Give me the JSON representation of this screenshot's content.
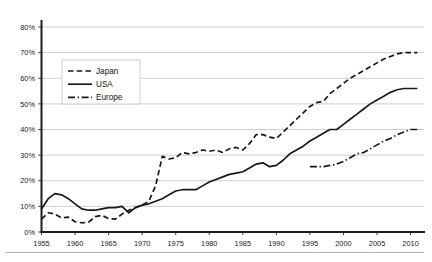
{
  "chart_data": {
    "type": "line",
    "title": "",
    "subtitle": "",
    "xlabel": "",
    "ylabel": "",
    "xlim": [
      1955,
      2012
    ],
    "ylim": [
      0,
      80
    ],
    "ytick_labels": [
      "0%",
      "10%",
      "20%",
      "30%",
      "40%",
      "50%",
      "60%",
      "70%",
      "80%"
    ],
    "ytick_values": [
      0,
      10,
      20,
      30,
      40,
      50,
      60,
      70,
      80
    ],
    "xtick_labels": [
      "1955",
      "1960",
      "1965",
      "1970",
      "1975",
      "1980",
      "1985",
      "1990",
      "1995",
      "2000",
      "2005",
      "2010"
    ],
    "xtick_values": [
      1955,
      1960,
      1965,
      1970,
      1975,
      1980,
      1985,
      1990,
      1995,
      2000,
      2005,
      2010
    ],
    "grid": true,
    "legend_position": "upper-left-inside",
    "legend": [
      "Japan",
      "USA",
      "Europe"
    ],
    "series": [
      {
        "name": "Japan",
        "style": "dashed",
        "x": [
          1955,
          1956,
          1957,
          1958,
          1959,
          1960,
          1961,
          1962,
          1963,
          1964,
          1965,
          1966,
          1967,
          1968,
          1969,
          1970,
          1971,
          1972,
          1973,
          1974,
          1975,
          1976,
          1977,
          1978,
          1979,
          1980,
          1981,
          1982,
          1983,
          1984,
          1985,
          1986,
          1987,
          1988,
          1989,
          1990,
          1991,
          1992,
          1993,
          1994,
          1995,
          1996,
          1997,
          1998,
          1999,
          2000,
          2001,
          2002,
          2003,
          2004,
          2005,
          2006,
          2007,
          2008,
          2009,
          2010,
          2011
        ],
        "values": [
          5.0,
          7.5,
          7.0,
          5.5,
          5.8,
          4.0,
          3.6,
          3.8,
          6.0,
          6.5,
          5.2,
          5.0,
          7.0,
          8.5,
          9.5,
          10.5,
          12.0,
          18.0,
          29.5,
          28.5,
          29.0,
          31.0,
          30.5,
          31.0,
          32.0,
          31.5,
          32.0,
          31.0,
          32.5,
          33.0,
          32.0,
          34.5,
          38.0,
          38.0,
          37.0,
          36.5,
          39.0,
          41.5,
          44.0,
          46.5,
          49.0,
          50.5,
          51.0,
          54.0,
          56.0,
          58.0,
          60.0,
          61.5,
          63.0,
          64.5,
          66.0,
          67.5,
          68.5,
          69.5,
          70.0,
          70.0,
          70.0
        ]
      },
      {
        "name": "USA",
        "style": "solid",
        "x": [
          1955,
          1956,
          1957,
          1958,
          1959,
          1960,
          1961,
          1962,
          1963,
          1964,
          1965,
          1966,
          1967,
          1968,
          1969,
          1970,
          1971,
          1972,
          1973,
          1974,
          1975,
          1976,
          1977,
          1978,
          1979,
          1980,
          1981,
          1982,
          1983,
          1984,
          1985,
          1986,
          1987,
          1988,
          1989,
          1990,
          1991,
          1992,
          1993,
          1994,
          1995,
          1996,
          1997,
          1998,
          1999,
          2000,
          2001,
          2002,
          2003,
          2004,
          2005,
          2006,
          2007,
          2008,
          2009,
          2010,
          2011
        ],
        "values": [
          9.0,
          13.0,
          15.0,
          14.5,
          13.0,
          11.0,
          9.0,
          8.5,
          8.5,
          9.0,
          9.5,
          9.5,
          10.0,
          7.5,
          9.5,
          10.5,
          11.0,
          12.0,
          13.0,
          14.5,
          16.0,
          16.5,
          16.5,
          16.5,
          18.0,
          19.5,
          20.5,
          21.5,
          22.5,
          23.0,
          23.5,
          25.0,
          26.5,
          27.0,
          25.5,
          26.0,
          28.0,
          30.5,
          32.0,
          33.5,
          35.5,
          37.0,
          38.5,
          40.0,
          40.0,
          42.0,
          44.0,
          46.0,
          48.0,
          50.0,
          51.5,
          53.0,
          54.5,
          55.5,
          56.0,
          56.0,
          56.0
        ]
      },
      {
        "name": "Europe",
        "style": "dashdot",
        "x": [
          1995,
          1996,
          1997,
          1998,
          1999,
          2000,
          2001,
          2002,
          2003,
          2004,
          2005,
          2006,
          2007,
          2008,
          2009,
          2010,
          2011
        ],
        "values": [
          25.5,
          25.5,
          25.5,
          26.0,
          26.5,
          27.5,
          29.0,
          30.5,
          31.0,
          32.5,
          34.0,
          35.5,
          36.5,
          38.0,
          39.0,
          40.0,
          40.0
        ]
      }
    ]
  },
  "colors": {
    "line": "#191919",
    "grid": "#b9b9b9",
    "axis": "#1d1d1d",
    "background": "#ffffff",
    "legend_border": "#c2c2c2"
  }
}
